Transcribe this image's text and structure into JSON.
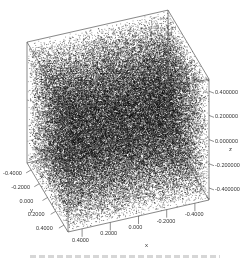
{
  "chart_data": {
    "type": "scatter",
    "subtype": "3d-point-cloud",
    "title": "",
    "x": {
      "label": "x",
      "ticks": [
        "0.4000",
        "0.2000",
        "0.000",
        "-0.2000",
        "-0.4000"
      ],
      "range": [
        -0.5,
        0.5
      ]
    },
    "y": {
      "label": "y",
      "ticks": [
        "-0.4000",
        "-0.2000",
        "0.000",
        "0.2000",
        "0.4000"
      ],
      "range": [
        -0.5,
        0.5
      ]
    },
    "z": {
      "label": "z",
      "ticks": [
        "0.400000",
        "0.200000",
        "0.000000",
        "-0.200000",
        "-0.400000"
      ],
      "range": [
        -0.5,
        0.5
      ]
    },
    "point_color": "#000000",
    "box_color": "#555555",
    "grid": false,
    "legend": null
  },
  "caption": {
    "visible": true,
    "legible": false
  }
}
